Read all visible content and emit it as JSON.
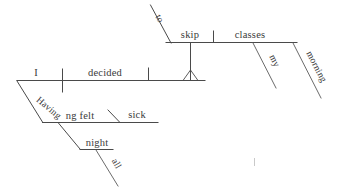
{
  "document": {
    "type": "reed-kellogg-sentence-diagram",
    "sentence": "Having felt sick all night, I decided to skip my morning classes.",
    "background_color": "#ffffff",
    "ink_color": "#4a4a4a",
    "text_color": "#3a3a3a"
  },
  "words": {
    "subject": "I",
    "main_verb": "decided",
    "infinitive_marker": "to",
    "infinitive_verb": "skip",
    "direct_object": "classes",
    "object_modifier_1": "my",
    "object_modifier_2": "morning",
    "participle_part_1": "Having",
    "participle_part_2": "ng felt",
    "participle_complement": "sick",
    "adverbial_noun": "night",
    "adverbial_modifier": "all"
  },
  "structure": {
    "main_clause_label": "main-clause-baseline",
    "participial_phrase_label": "participial-phrase",
    "infinitive_phrase_label": "infinitive-phrase",
    "pedestal_label": "infinitive-pedestal"
  }
}
